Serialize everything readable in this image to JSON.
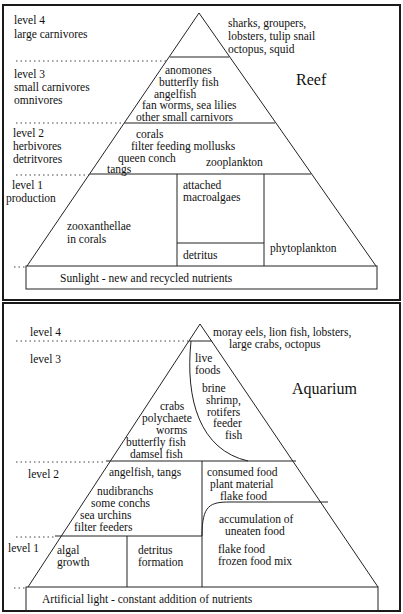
{
  "reef": {
    "title": "Reef",
    "levels": {
      "l4": {
        "name": "level 4",
        "desc": "large carnivores"
      },
      "l3": {
        "name": "level 3",
        "desc1": "small carnivores",
        "desc2": "omnivores"
      },
      "l2": {
        "name": "level 2",
        "desc1": "herbivores",
        "desc2": "detritvores"
      },
      "l1": {
        "name": "level 1",
        "desc": "production"
      }
    },
    "top_species": [
      "sharks, groupers,",
      "lobsters, tulip snail",
      "octopus, squid"
    ],
    "level3_species": [
      "anomones",
      "butterfly fish",
      "angelfish",
      "fan worms, sea lilies",
      "other small carnivors"
    ],
    "level2_species": {
      "corals": "corals",
      "mollusks": "filter feeding mollusks",
      "conch": "queen conch",
      "tangs": "tangs",
      "zooplankton": "zooplankton"
    },
    "level1": {
      "zoox1": "zooxanthellae",
      "zoox2": "in corals",
      "macro1": "attached",
      "macro2": "macroalgaes",
      "detritus": "detritus",
      "phyto": "phytoplankton"
    },
    "base": "Sunlight - new and recycled nutrients"
  },
  "aquarium": {
    "title": "Aquarium",
    "levels": {
      "l4": "level 4",
      "l3": "level 3",
      "l2": "level 2",
      "l1": "level 1"
    },
    "top_species": [
      "moray eels, lion fish, lobsters,",
      "large crabs, octopus"
    ],
    "live_foods": [
      "live",
      "foods"
    ],
    "brine": [
      "brine",
      "shrimp,",
      "rotifers",
      "feeder",
      "fish"
    ],
    "level3_species": [
      "crabs",
      "polychaete",
      "worms",
      "butterfly fish",
      "damsel fish"
    ],
    "level2_left": {
      "a": "angelfish, tangs",
      "b": "nudibranchs",
      "c": "some conchs",
      "d": "sea urchins",
      "e": "filter feeders"
    },
    "level2_right": [
      "consumed food",
      "plant material",
      "flake food"
    ],
    "accumulation": [
      "accumulation of",
      "uneaten food"
    ],
    "feed": [
      "flake food",
      "frozen food mix"
    ],
    "level1": {
      "algal1": "algal",
      "algal2": "growth",
      "det1": "detritus",
      "det2": "formation"
    },
    "base": "Artificial light - constant addition of nutrients"
  }
}
